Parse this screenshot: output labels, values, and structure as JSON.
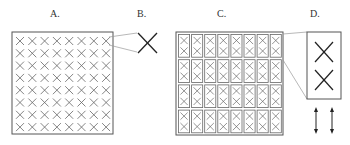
{
  "panels": [
    {
      "id": "A",
      "label": "A.",
      "description": "8x8 grid of X marks in a square"
    },
    {
      "id": "B",
      "label": "B.",
      "description": "Magnified single X mark"
    },
    {
      "id": "C",
      "label": "C.",
      "description": "8x4 grid of bordered cells, each containing two stacked X marks"
    },
    {
      "id": "D",
      "label": "D.",
      "description": "Magnified single cell with two stacked X marks"
    }
  ],
  "grid_a": {
    "rows": 8,
    "cols": 8
  },
  "grid_c": {
    "rows": 4,
    "cols": 8,
    "marks_per_cell": 2
  },
  "arrows": {
    "count": 2,
    "type": "vertical-double-headed"
  },
  "colors": {
    "stroke": "#444444",
    "light_stroke": "#888888",
    "background": "#ffffff"
  }
}
